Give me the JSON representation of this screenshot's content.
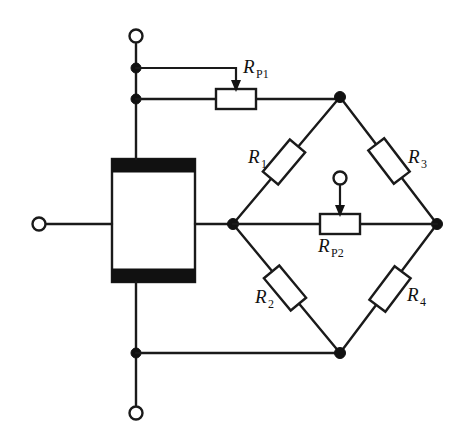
{
  "diagram": {
    "colors": {
      "wire": "#1a1a1a",
      "node": "#111111",
      "background": "#ffffff",
      "bar_fill": "#111111",
      "box_fill": "#ffffff"
    },
    "components": {
      "rp1": {
        "label": "R",
        "subscript": "P1",
        "name": "potentiometer-rp1"
      },
      "rp2": {
        "label": "R",
        "subscript": "P2",
        "name": "potentiometer-rp2"
      },
      "r1": {
        "label": "R",
        "subscript": "1",
        "name": "resistor-r1"
      },
      "r2": {
        "label": "R",
        "subscript": "2",
        "name": "resistor-r2"
      },
      "r3": {
        "label": "R",
        "subscript": "3",
        "name": "resistor-r3"
      },
      "r4": {
        "label": "R",
        "subscript": "4",
        "name": "resistor-r4"
      }
    },
    "terminals": {
      "top": "terminal-top",
      "bottom": "terminal-bottom",
      "left": "terminal-left",
      "rp1_wiper": "wiper-rp1",
      "rp2_wiper": "wiper-rp2"
    }
  }
}
